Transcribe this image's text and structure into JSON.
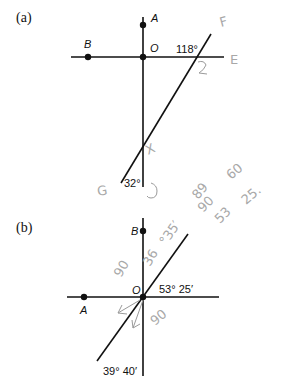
{
  "figure_a": {
    "label": "(a)",
    "points": {
      "A": "A",
      "B": "B",
      "O": "O"
    },
    "angles": {
      "upper": "118°",
      "lower": "32°"
    },
    "handwritten": {
      "F": "F",
      "E": "E",
      "angle_mark": "2",
      "X": "X",
      "G": "G",
      "hook": "J"
    }
  },
  "figure_b": {
    "label": "(b)",
    "points": {
      "A": "A",
      "B": "B",
      "O": "O"
    },
    "angles": {
      "upper": "53° 25′",
      "lower": "39° 40′"
    },
    "handwritten": {
      "n90_left": "90",
      "n36": "36",
      "n35": "°35′",
      "n90_right": "90",
      "n89": "89",
      "n60": "60",
      "n90_mid": "90",
      "n53": "53",
      "n25": "25."
    }
  },
  "colors": {
    "ink": "#111111",
    "pencil": "#a8a8a8"
  }
}
